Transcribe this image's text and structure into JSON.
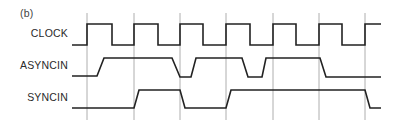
{
  "panel_label": "(b)",
  "signals": [
    {
      "name": "CLOCK",
      "label_y": 27
    },
    {
      "name": "ASYNCIN",
      "label_y": 59
    },
    {
      "name": "SYNCIN",
      "label_y": 91
    }
  ],
  "gridlines_x": [
    87,
    134,
    180,
    226,
    273,
    319,
    365
  ],
  "waveforms": {
    "clock": "72,45 87,45 87,24 112,24 112,45 134,45 134,24 158,24 158,45 180,45 180,24 203,24 203,45 226,45 226,24 250,24 250,45 273,45 273,24 296,24 296,45 319,45 319,24 342,24 342,45 365,45 365,24 381,24",
    "asyncin": "72,76 97,76 104,58 172,58 180,77 191,77 196,58 242,58 248,77 262,77 266,58 320,58 326,77 381,77",
    "syncin": "72,108 134,108 139,90 180,90 185,108 226,108 231,90 365,90 370,108 381,108"
  },
  "colors": {
    "trace": "#222222",
    "grid": "#9a9a9a"
  }
}
